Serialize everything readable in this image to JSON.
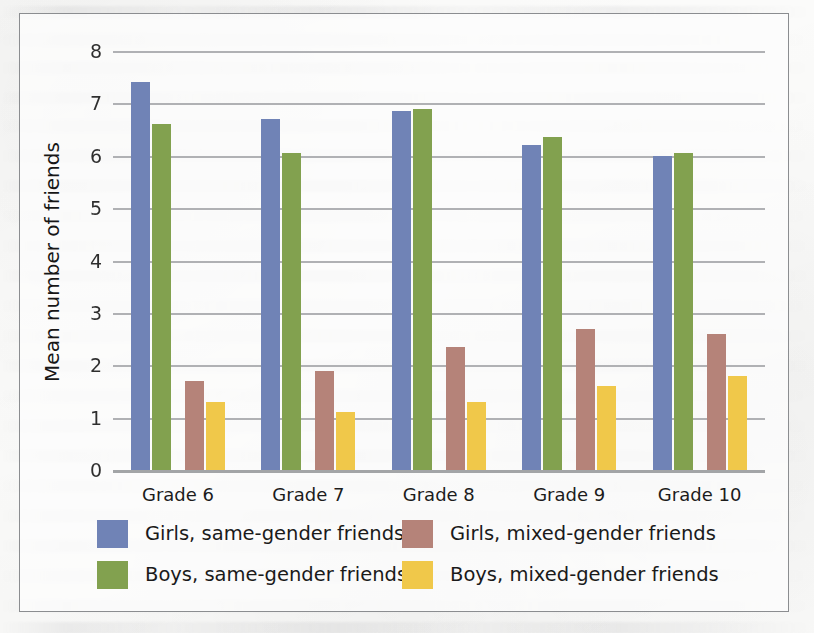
{
  "chart_data": {
    "type": "bar",
    "title": "",
    "subtitle": "",
    "xlabel": "",
    "ylabel": "Mean number of friends",
    "ylim": [
      0,
      8
    ],
    "ytick_labels": [
      "8",
      "7",
      "6",
      "5",
      "4",
      "3",
      "2",
      "1",
      "0"
    ],
    "ytick_values": [
      8,
      7,
      6,
      5,
      4,
      3,
      2,
      1,
      0
    ],
    "grid": true,
    "legend_position": "bottom",
    "categories": [
      "Grade 6",
      "Grade 7",
      "Grade 8",
      "Grade 9",
      "Grade 10"
    ],
    "series": [
      {
        "name": "Girls, same-gender friends",
        "color": "#7083b6",
        "values": [
          7.4,
          6.7,
          6.85,
          6.2,
          6.0
        ]
      },
      {
        "name": "Boys, same-gender friends",
        "color": "#82a14f",
        "values": [
          6.6,
          6.05,
          6.9,
          6.35,
          6.05
        ]
      },
      {
        "name": "Girls, mixed-gender friends",
        "color": "#b58379",
        "values": [
          1.7,
          1.9,
          2.35,
          2.7,
          2.6
        ]
      },
      {
        "name": "Boys, mixed-gender friends",
        "color": "#f0c84a",
        "values": [
          1.3,
          1.1,
          1.3,
          1.6,
          1.8
        ]
      }
    ]
  },
  "legend": {
    "entries": [
      {
        "label": "Girls, same-gender friends",
        "series_index": 0
      },
      {
        "label": "Girls, mixed-gender friends",
        "series_index": 2
      },
      {
        "label": "Boys, same-gender friends",
        "series_index": 1
      },
      {
        "label": "Boys, mixed-gender friends",
        "series_index": 3
      }
    ]
  },
  "colors": {
    "girls_same_gender": "#7083b6",
    "boys_same_gender": "#82a14f",
    "girls_mixed_gender": "#b58379",
    "boys_mixed_gender": "#f0c84a",
    "gridline": "#a9abae",
    "frame_border": "#8b8d90",
    "text": "#1c1c1c",
    "background": "#fbfbfa"
  }
}
